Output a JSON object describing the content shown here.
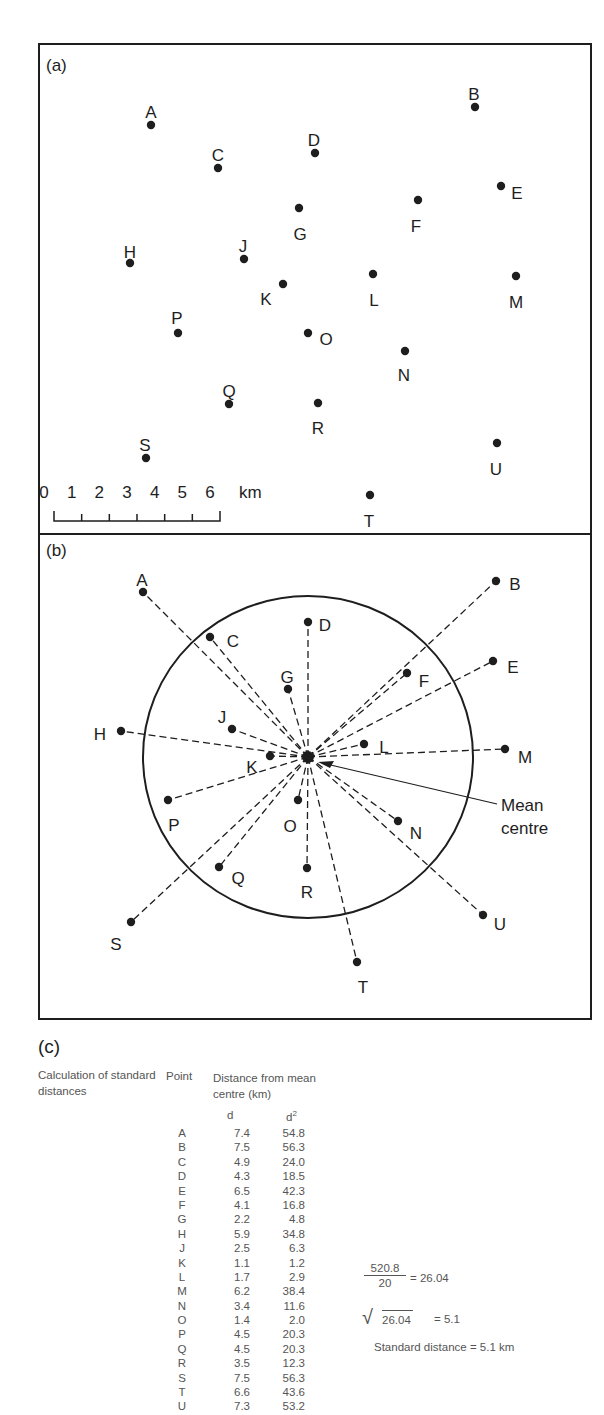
{
  "panel_a": {
    "label": "(a)",
    "points": [
      {
        "name": "A",
        "x": 151,
        "y": 125,
        "lx": 151,
        "ly": 112
      },
      {
        "name": "B",
        "x": 475,
        "y": 107,
        "lx": 474,
        "ly": 94
      },
      {
        "name": "C",
        "x": 218,
        "y": 168,
        "lx": 218,
        "ly": 155
      },
      {
        "name": "D",
        "x": 315,
        "y": 153,
        "lx": 314,
        "ly": 140
      },
      {
        "name": "E",
        "x": 501,
        "y": 186,
        "lx": 517,
        "ly": 193
      },
      {
        "name": "F",
        "x": 418,
        "y": 200,
        "lx": 416,
        "ly": 226
      },
      {
        "name": "G",
        "x": 299,
        "y": 208,
        "lx": 300,
        "ly": 234
      },
      {
        "name": "H",
        "x": 130,
        "y": 263,
        "lx": 130,
        "ly": 252
      },
      {
        "name": "J",
        "x": 244,
        "y": 259,
        "lx": 243,
        "ly": 246
      },
      {
        "name": "K",
        "x": 283,
        "y": 284,
        "lx": 266,
        "ly": 299
      },
      {
        "name": "L",
        "x": 373,
        "y": 274,
        "lx": 374,
        "ly": 300
      },
      {
        "name": "M",
        "x": 516,
        "y": 276,
        "lx": 516,
        "ly": 302
      },
      {
        "name": "N",
        "x": 405,
        "y": 351,
        "lx": 404,
        "ly": 375
      },
      {
        "name": "O",
        "x": 308,
        "y": 333,
        "lx": 326,
        "ly": 339
      },
      {
        "name": "P",
        "x": 178,
        "y": 333,
        "lx": 177,
        "ly": 318
      },
      {
        "name": "Q",
        "x": 229,
        "y": 404,
        "lx": 229,
        "ly": 391
      },
      {
        "name": "R",
        "x": 318,
        "y": 403,
        "lx": 318,
        "ly": 428
      },
      {
        "name": "S",
        "x": 146,
        "y": 458,
        "lx": 145,
        "ly": 445
      },
      {
        "name": "T",
        "x": 370,
        "y": 495,
        "lx": 369,
        "ly": 521
      },
      {
        "name": "U",
        "x": 497,
        "y": 443,
        "lx": 496,
        "ly": 469
      }
    ],
    "scale_bar": {
      "ticks": [
        "0",
        "1",
        "2",
        "3",
        "4",
        "5",
        "6"
      ],
      "unit": "km"
    }
  },
  "panel_b": {
    "label": "(b)",
    "mean_centre": {
      "x": 308,
      "y": 757
    },
    "mean_centre_label": [
      "Mean",
      "centre"
    ],
    "circle": {
      "cx": 308,
      "cy": 757,
      "rx": 165,
      "ry": 161
    },
    "points": [
      {
        "name": "A",
        "x": 143,
        "y": 592,
        "lx": 142,
        "ly": 580
      },
      {
        "name": "B",
        "x": 496,
        "y": 581,
        "lx": 515,
        "ly": 584
      },
      {
        "name": "C",
        "x": 210,
        "y": 637,
        "lx": 233,
        "ly": 641
      },
      {
        "name": "D",
        "x": 308,
        "y": 622,
        "lx": 325,
        "ly": 625
      },
      {
        "name": "E",
        "x": 493,
        "y": 661,
        "lx": 513,
        "ly": 667
      },
      {
        "name": "F",
        "x": 407,
        "y": 673,
        "lx": 424,
        "ly": 681
      },
      {
        "name": "G",
        "x": 288,
        "y": 689,
        "lx": 287,
        "ly": 677
      },
      {
        "name": "H",
        "x": 121,
        "y": 731,
        "lx": 100,
        "ly": 734
      },
      {
        "name": "J",
        "x": 232,
        "y": 729,
        "lx": 222,
        "ly": 717
      },
      {
        "name": "K",
        "x": 270,
        "y": 756,
        "lx": 252,
        "ly": 767
      },
      {
        "name": "L",
        "x": 364,
        "y": 744,
        "lx": 384,
        "ly": 747
      },
      {
        "name": "M",
        "x": 505,
        "y": 749,
        "lx": 525,
        "ly": 757
      },
      {
        "name": "N",
        "x": 398,
        "y": 821,
        "lx": 416,
        "ly": 833
      },
      {
        "name": "O",
        "x": 298,
        "y": 800,
        "lx": 290,
        "ly": 826
      },
      {
        "name": "P",
        "x": 168,
        "y": 800,
        "lx": 174,
        "ly": 825
      },
      {
        "name": "Q",
        "x": 219,
        "y": 867,
        "lx": 238,
        "ly": 878
      },
      {
        "name": "R",
        "x": 307,
        "y": 868,
        "lx": 307,
        "ly": 892
      },
      {
        "name": "S",
        "x": 131,
        "y": 922,
        "lx": 116,
        "ly": 944
      },
      {
        "name": "T",
        "x": 357,
        "y": 962,
        "lx": 363,
        "ly": 987
      },
      {
        "name": "U",
        "x": 483,
        "y": 915,
        "lx": 500,
        "ly": 924
      }
    ]
  },
  "panel_c": {
    "label": "(c)",
    "title": "Calculation of standard distances",
    "header_point": "Point",
    "header_distance": "Distance from mean centre (km)",
    "col_d": "d",
    "col_d2": "d",
    "col_d2_sup": "2",
    "rows": [
      {
        "point": "A",
        "d": "7.4",
        "d2": "54.8"
      },
      {
        "point": "B",
        "d": "7.5",
        "d2": "56.3"
      },
      {
        "point": "C",
        "d": "4.9",
        "d2": "24.0"
      },
      {
        "point": "D",
        "d": "4.3",
        "d2": "18.5"
      },
      {
        "point": "E",
        "d": "6.5",
        "d2": "42.3"
      },
      {
        "point": "F",
        "d": "4.1",
        "d2": "16.8"
      },
      {
        "point": "G",
        "d": "2.2",
        "d2": "4.8"
      },
      {
        "point": "H",
        "d": "5.9",
        "d2": "34.8"
      },
      {
        "point": "J",
        "d": "2.5",
        "d2": "6.3"
      },
      {
        "point": "K",
        "d": "1.1",
        "d2": "1.2"
      },
      {
        "point": "L",
        "d": "1.7",
        "d2": "2.9"
      },
      {
        "point": "M",
        "d": "6.2",
        "d2": "38.4"
      },
      {
        "point": "N",
        "d": "3.4",
        "d2": "11.6"
      },
      {
        "point": "O",
        "d": "1.4",
        "d2": "2.0"
      },
      {
        "point": "P",
        "d": "4.5",
        "d2": "20.3"
      },
      {
        "point": "Q",
        "d": "4.5",
        "d2": "20.3"
      },
      {
        "point": "R",
        "d": "3.5",
        "d2": "12.3"
      },
      {
        "point": "S",
        "d": "7.5",
        "d2": "56.3"
      },
      {
        "point": "T",
        "d": "6.6",
        "d2": "43.6"
      },
      {
        "point": "U",
        "d": "7.3",
        "d2": "53.2"
      }
    ],
    "calc": {
      "numerator": "520.8",
      "denominator": "20",
      "equals_1": "= 26.04",
      "sqrt_sign": "√",
      "sqrt_arg": "26.04",
      "equals_2": "= 5.1",
      "result": "Standard distance = 5.1 km"
    }
  }
}
